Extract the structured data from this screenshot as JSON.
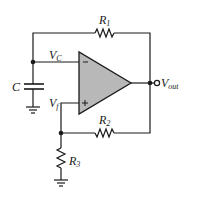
{
  "diagram": {
    "type": "circuit-schematic",
    "components": {
      "R1": {
        "label": "R",
        "sub": "1"
      },
      "R2": {
        "label": "R",
        "sub": "2"
      },
      "R3": {
        "label": "R",
        "sub": "3"
      },
      "C": {
        "label": "C"
      },
      "opamp": {
        "inverting": "−",
        "noninverting": "+"
      }
    },
    "nodes": {
      "vc": {
        "label": "V",
        "sub": "C"
      },
      "vf": {
        "label": "V",
        "sub": "f"
      },
      "vout": {
        "label": "V",
        "sub": "out"
      }
    },
    "colors": {
      "wire": "#1a1a1a",
      "opamp_fill": "#b8b8b8",
      "background": "#ffffff"
    }
  }
}
